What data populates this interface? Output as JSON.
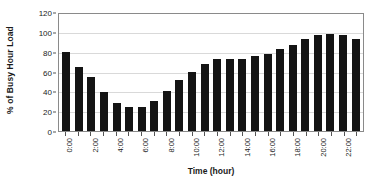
{
  "chart_data": {
    "type": "bar",
    "title": "",
    "xlabel": "Time (hour)",
    "ylabel": "% of Busy Hour Load",
    "ylim": [
      0,
      120
    ],
    "ytick_values": [
      0,
      20,
      40,
      60,
      80,
      100,
      120
    ],
    "ytick_labels": [
      "0",
      "20",
      "40",
      "60",
      "80",
      "100",
      "120"
    ],
    "grid": "horizontal",
    "legend": "none",
    "bar_color": "#141414",
    "gridline_color": "#d9d9d9",
    "axis_color": "#8a8a8a",
    "categories": [
      "0:00",
      "1:00",
      "2:00",
      "3:00",
      "4:00",
      "5:00",
      "6:00",
      "7:00",
      "8:00",
      "9:00",
      "10:00",
      "11:00",
      "12:00",
      "13:00",
      "14:00",
      "15:00",
      "16:00",
      "17:00",
      "18:00",
      "19:00",
      "20:00",
      "21:00",
      "22:00",
      "23:00"
    ],
    "xtick_labels": [
      "0:00",
      "",
      "2:00",
      "",
      "4:00",
      "",
      "6:00",
      "",
      "8:00",
      "",
      "10:00",
      "",
      "12:00",
      "",
      "14:00",
      "",
      "16:00",
      "",
      "18:00",
      "",
      "20:00",
      "",
      "22:00",
      ""
    ],
    "values": [
      81,
      66,
      55,
      40,
      29,
      25,
      25,
      31,
      41,
      52,
      61,
      69,
      74,
      74,
      74,
      77,
      79,
      84,
      88,
      94,
      98,
      100,
      98,
      94
    ]
  }
}
